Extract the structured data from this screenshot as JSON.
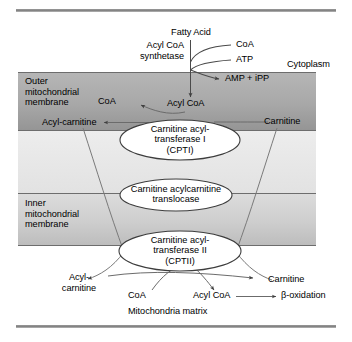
{
  "figure": {
    "colors": {
      "outer_membrane_top": "#b0b0b0",
      "outer_membrane_bottom": "#9a9a9a",
      "inner_membrane_top": "#d8d8d8",
      "inner_membrane_bottom": "#c2c2c2",
      "intermembrane_space": "#e8e8e8",
      "matrix": "#ffffff",
      "line": "#4a4a4a",
      "rule": "#8a8a8a",
      "text": "#000000"
    }
  },
  "compartments": {
    "cytoplasm": "Cytoplasm",
    "outer_membrane": "Outer\nmitochondrial\nmembrane",
    "inner_membrane": "Inner\nmitochondrial\nmembrane",
    "matrix": "Mitochondria matrix"
  },
  "cytoplasm_species": {
    "fatty_acid": "Fatty Acid",
    "enzyme": "Acyl CoA\nsynthetase",
    "coa_in": "CoA",
    "atp_in": "ATP",
    "amp_ipp_out": "AMP + iPP",
    "acyl_coa": "Acyl CoA",
    "coa_released": "CoA",
    "acyl_carnitine": "Acyl-carnitine",
    "carnitine": "Carnitine"
  },
  "matrix_species": {
    "acyl_carnitine": "Acyl-\ncarnitine",
    "coa": "CoA",
    "acyl_coa": "Acyl CoA",
    "carnitine": "Carnitine",
    "beta_oxidation": "β-oxidation"
  },
  "enzymes": [
    {
      "id": "cpt1",
      "label": "Carnitine acyl-\ntransferase I\n(CPTI)",
      "name": "Carnitine acyltransferase I",
      "abbr": "CPTI"
    },
    {
      "id": "translocase",
      "label": "Carnitine acylcarnitine\ntranslocase",
      "name": "Carnitine acylcarnitine translocase",
      "abbr": ""
    },
    {
      "id": "cpt2",
      "label": "Carnitine acyl-\ntransferase II\n(CPTII)",
      "name": "Carnitine acyltransferase II",
      "abbr": "CPTII"
    }
  ]
}
